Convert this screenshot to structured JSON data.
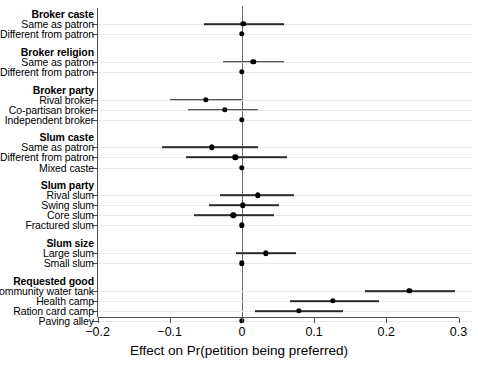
{
  "chart_data": {
    "type": "scatter",
    "plot_kind": "coefficient-dot-and-whisker",
    "title": "",
    "xlabel": "Effect on Pr(petition being preferred)",
    "ylabel": "",
    "xlim": [
      -0.2,
      0.3
    ],
    "xticks": [
      -0.2,
      -0.1,
      0,
      0.1,
      0.2,
      0.3
    ],
    "xticklabels": [
      "−0.2",
      "−0.1",
      "0",
      "0.1",
      "0.2",
      "0.3"
    ],
    "grid": "horizontal-row-rules",
    "legend": "none",
    "reference_line_x": 0,
    "groups": [
      {
        "name": "Broker caste",
        "items": [
          {
            "label": "Same as patron",
            "estimate": 0.002,
            "ci_low": -0.053,
            "ci_high": 0.058,
            "reference": false
          },
          {
            "label": "Different from patron",
            "estimate": 0.0,
            "ci_low": 0.0,
            "ci_high": 0.0,
            "reference": true
          }
        ]
      },
      {
        "name": "Broker religion",
        "items": [
          {
            "label": "Same as patron",
            "estimate": 0.016,
            "ci_low": -0.026,
            "ci_high": 0.058,
            "reference": false
          },
          {
            "label": "Different from patron",
            "estimate": 0.0,
            "ci_low": 0.0,
            "ci_high": 0.0,
            "reference": true
          }
        ]
      },
      {
        "name": "Broker party",
        "items": [
          {
            "label": "Rival broker",
            "estimate": -0.05,
            "ci_low": -0.1,
            "ci_high": 0.0,
            "reference": false
          },
          {
            "label": "Co-partisan broker",
            "estimate": -0.024,
            "ci_low": -0.074,
            "ci_high": 0.022,
            "reference": false
          },
          {
            "label": "Independent broker",
            "estimate": 0.0,
            "ci_low": 0.0,
            "ci_high": 0.0,
            "reference": true
          }
        ]
      },
      {
        "name": "Slum caste",
        "items": [
          {
            "label": "Same as patron",
            "estimate": -0.042,
            "ci_low": -0.11,
            "ci_high": 0.022,
            "reference": false
          },
          {
            "label": "Different from patron",
            "estimate": -0.009,
            "ci_low": -0.078,
            "ci_high": 0.062,
            "reference": false
          },
          {
            "label": "Mixed caste",
            "estimate": 0.0,
            "ci_low": 0.0,
            "ci_high": 0.0,
            "reference": true
          }
        ]
      },
      {
        "name": "Slum party",
        "items": [
          {
            "label": "Rival slum",
            "estimate": 0.022,
            "ci_low": -0.03,
            "ci_high": 0.072,
            "reference": false
          },
          {
            "label": "Swing slum",
            "estimate": 0.001,
            "ci_low": -0.046,
            "ci_high": 0.051,
            "reference": false
          },
          {
            "label": "Core slum",
            "estimate": -0.012,
            "ci_low": -0.066,
            "ci_high": 0.044,
            "reference": false
          },
          {
            "label": "Fractured slum",
            "estimate": 0.0,
            "ci_low": 0.0,
            "ci_high": 0.0,
            "reference": true
          }
        ]
      },
      {
        "name": "Slum size",
        "items": [
          {
            "label": "Large slum",
            "estimate": 0.033,
            "ci_low": -0.008,
            "ci_high": 0.075,
            "reference": false
          },
          {
            "label": "Small slum",
            "estimate": 0.0,
            "ci_low": 0.0,
            "ci_high": 0.0,
            "reference": true
          }
        ]
      },
      {
        "name": "Requested good",
        "items": [
          {
            "label": "Community water tank",
            "estimate": 0.232,
            "ci_low": 0.17,
            "ci_high": 0.295,
            "reference": false
          },
          {
            "label": "Health camp",
            "estimate": 0.126,
            "ci_low": 0.066,
            "ci_high": 0.19,
            "reference": false
          },
          {
            "label": "Ration card camp",
            "estimate": 0.079,
            "ci_low": 0.018,
            "ci_high": 0.14,
            "reference": false
          },
          {
            "label": "Paving alley",
            "estimate": 0.0,
            "ci_low": 0.0,
            "ci_high": 0.0,
            "reference": true
          }
        ]
      }
    ]
  },
  "style": {
    "point_color": "#000000",
    "ci_color": "#2b2b2b",
    "axis_color": "#4d4d4d",
    "rowline_color": "#e9e9e9",
    "zeroline_color": "#6e6e6e",
    "background": "#ffffff"
  }
}
